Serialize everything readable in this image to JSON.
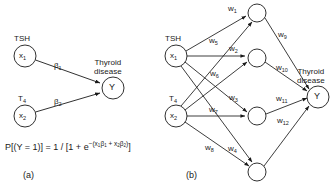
{
  "figure": {
    "type": "diagram",
    "title": "",
    "background_color": "#ffffff",
    "stroke_color": "#1a1a1a",
    "panels": [
      {
        "id": "a",
        "tag": "(a)",
        "caption": "logistic regression model",
        "input_nodes": [
          {
            "id": "a-x1",
            "node_label": "x",
            "node_sub": "1",
            "var_label": "TSH"
          },
          {
            "id": "a-x2",
            "node_label": "x",
            "node_sub": "2",
            "var_label": "T",
            "var_sub": "4"
          }
        ],
        "output_node": {
          "id": "a-y",
          "node_label": "Y",
          "title_line1": "Thyroid",
          "title_line2": "disease"
        },
        "edge_labels": [
          {
            "id": "beta1",
            "base": "β",
            "sub": "1"
          },
          {
            "id": "beta2",
            "base": "β",
            "sub": "2"
          }
        ],
        "formula": {
          "lhs": "P[(Y = 1)] = 1 / [1 + e",
          "exp_lead": "−(x",
          "exp_sub1": "1",
          "exp_b1": "β",
          "exp_b1sub": "1",
          "exp_plus": " + x",
          "exp_sub2": "2",
          "exp_b2": "β",
          "exp_b2sub": "2",
          "exp_close": ")",
          "tail": "]"
        }
      },
      {
        "id": "b",
        "tag": "(b)",
        "caption": "neural network model",
        "input_nodes": [
          {
            "id": "b-x1",
            "node_label": "x",
            "node_sub": "1",
            "var_label": "TSH"
          },
          {
            "id": "b-x2",
            "node_label": "x",
            "node_sub": "2",
            "var_label": "T",
            "var_sub": "4"
          }
        ],
        "hidden_nodes": [
          {
            "id": "h1",
            "node_label": ""
          },
          {
            "id": "h2",
            "node_label": ""
          },
          {
            "id": "h3",
            "node_label": ""
          },
          {
            "id": "h4",
            "node_label": ""
          }
        ],
        "output_node": {
          "id": "b-y",
          "node_label": "Y",
          "title_line1": "Thyroid",
          "title_line2": "disease"
        },
        "edge_labels": [
          {
            "id": "w1",
            "base": "w",
            "sub": "1"
          },
          {
            "id": "w2",
            "base": "w",
            "sub": "2"
          },
          {
            "id": "w3",
            "base": "w",
            "sub": "3"
          },
          {
            "id": "w4",
            "base": "w",
            "sub": "4"
          },
          {
            "id": "w5",
            "base": "w",
            "sub": "5"
          },
          {
            "id": "w6",
            "base": "w",
            "sub": "6"
          },
          {
            "id": "w7",
            "base": "w",
            "sub": "7"
          },
          {
            "id": "w8",
            "base": "w",
            "sub": "8"
          },
          {
            "id": "w9",
            "base": "w",
            "sub": "9"
          },
          {
            "id": "w10",
            "base": "w",
            "sub": "10"
          },
          {
            "id": "w11",
            "base": "w",
            "sub": "11"
          },
          {
            "id": "w12",
            "base": "w",
            "sub": "12"
          }
        ]
      }
    ]
  }
}
